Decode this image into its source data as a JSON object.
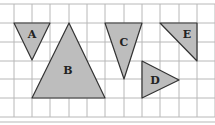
{
  "figure": {
    "grid": {
      "x_lines": [
        14,
        32,
        50,
        69,
        87,
        105,
        124,
        142,
        160,
        179,
        197,
        215
      ],
      "y_lines": [
        4,
        23,
        42,
        61,
        79,
        98,
        117
      ],
      "color": "#b8b8b8",
      "bottom_rule_y": 122
    },
    "fill_color": "#bdbdbd",
    "stroke_color": "#333333",
    "shapes": [
      {
        "label": "A",
        "points": "14,23 50,23 32,60",
        "label_x": 32,
        "label_y": 38
      },
      {
        "label": "B",
        "points": "69,23 105,98 32,98",
        "label_x": 68,
        "label_y": 74
      },
      {
        "label": "C",
        "points": "105,23 142,23 124,79",
        "label_x": 124,
        "label_y": 46
      },
      {
        "label": "D",
        "points": "142,61 179,80 142,98",
        "label_x": 155,
        "label_y": 84
      },
      {
        "label": "E",
        "points": "160,23 197,23 197,61",
        "label_x": 187,
        "label_y": 38
      }
    ]
  }
}
